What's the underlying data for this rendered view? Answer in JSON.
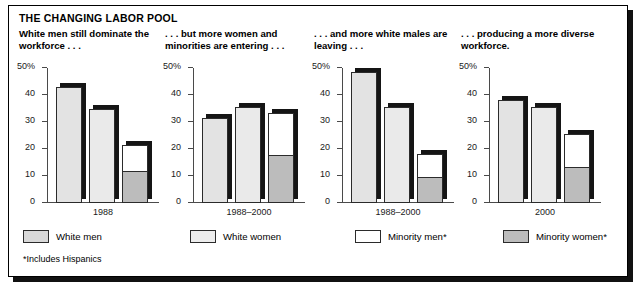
{
  "figure": {
    "main_title": "THE CHANGING LABOR POOL",
    "footnote": "*Includes Hispanics"
  },
  "legend": {
    "items": [
      {
        "label": "White men",
        "swatch": "white-men-swatch",
        "color": "#d8d8d8"
      },
      {
        "label": "White women",
        "swatch": "white-women-swatch",
        "color": "#ededed"
      },
      {
        "label": "Minority men*",
        "swatch": "minority-men-swatch",
        "color": "#ffffff"
      },
      {
        "label": "Minority women*",
        "swatch": "minority-women-swatch",
        "color": "#bcbcbc"
      }
    ]
  },
  "axis": {
    "tick_labels": [
      "50%",
      "40",
      "30",
      "20",
      "10",
      "0"
    ],
    "ymin": 0,
    "ymax": 50
  },
  "chart_data": [
    {
      "type": "bar",
      "title": "White men still dominate the workforce . . .",
      "xlabel": "1988",
      "ylabel": "",
      "categories": [
        "White men",
        "White women",
        "Minority"
      ],
      "ylim": [
        0,
        50
      ],
      "yticks": [
        0,
        10,
        20,
        30,
        40,
        50
      ],
      "grid": false,
      "values": [
        43,
        35,
        21.5
      ],
      "stacked_last_bar": {
        "minority_women": 11,
        "minority_men": 10.5,
        "total": 21.5
      }
    },
    {
      "type": "bar",
      "title": ". . . but more women and minorities are entering . . .",
      "xlabel": "1988–2000",
      "ylabel": "",
      "categories": [
        "White men",
        "White women",
        "Minority"
      ],
      "ylim": [
        0,
        50
      ],
      "yticks": [
        0,
        10,
        20,
        30,
        40,
        50
      ],
      "grid": false,
      "values": [
        31.5,
        35.5,
        33.5
      ],
      "stacked_last_bar": {
        "minority_women": 17,
        "minority_men": 16.5,
        "total": 33.5
      }
    },
    {
      "type": "bar",
      "title": ". . . and more white males are leaving . . .",
      "xlabel": "1988–2000",
      "ylabel": "",
      "categories": [
        "White men",
        "White women",
        "Minority"
      ],
      "ylim": [
        0,
        50
      ],
      "yticks": [
        0,
        10,
        20,
        30,
        40,
        50
      ],
      "grid": false,
      "values": [
        48.5,
        35.5,
        18
      ],
      "stacked_last_bar": {
        "minority_women": 9,
        "minority_men": 9,
        "total": 18
      }
    },
    {
      "type": "bar",
      "title": ". . . producing a more diverse workforce.",
      "xlabel": "2000",
      "ylabel": "",
      "categories": [
        "White men",
        "White women",
        "Minority"
      ],
      "ylim": [
        0,
        50
      ],
      "yticks": [
        0,
        10,
        20,
        30,
        40,
        50
      ],
      "grid": false,
      "values": [
        38,
        35.5,
        25.5
      ],
      "stacked_last_bar": {
        "minority_women": 12.5,
        "minority_men": 13,
        "total": 25.5
      }
    }
  ]
}
